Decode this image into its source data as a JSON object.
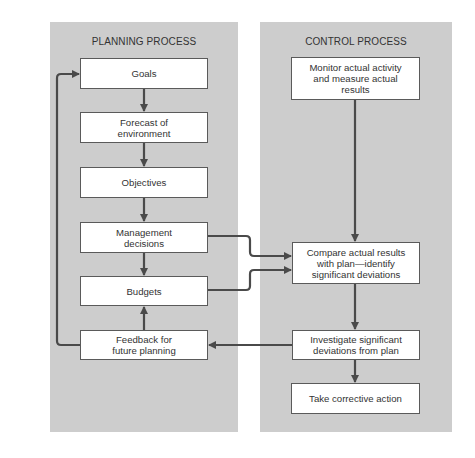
{
  "colors": {
    "panel_bg": "#cdcdcd",
    "box_bg": "#ffffff",
    "box_border": "#5a5a5a",
    "arrow": "#4a4a4a"
  },
  "planning": {
    "title": "PLANNING PROCESS",
    "boxes": {
      "goals": "Goals",
      "forecast": "Forecast of environment",
      "objectives": "Objectives",
      "management": "Management decisions",
      "budgets": "Budgets",
      "feedback": "Feedback for future planning"
    }
  },
  "control": {
    "title": "CONTROL PROCESS",
    "boxes": {
      "monitor": "Monitor actual activity and measure actual results",
      "compare": "Compare actual results with plan—identify significant deviations",
      "investigate": "Investigate significant deviations from plan",
      "corrective": "Take corrective action"
    }
  },
  "connections": [
    {
      "from": "goals",
      "to": "forecast"
    },
    {
      "from": "forecast",
      "to": "objectives"
    },
    {
      "from": "objectives",
      "to": "management"
    },
    {
      "from": "management",
      "to": "budgets"
    },
    {
      "from": "feedback",
      "to": "budgets"
    },
    {
      "from": "feedback",
      "to": "goals"
    },
    {
      "from": "management",
      "to": "compare"
    },
    {
      "from": "budgets",
      "to": "compare"
    },
    {
      "from": "monitor",
      "to": "compare"
    },
    {
      "from": "compare",
      "to": "investigate"
    },
    {
      "from": "investigate",
      "to": "feedback"
    },
    {
      "from": "investigate",
      "to": "corrective"
    }
  ]
}
